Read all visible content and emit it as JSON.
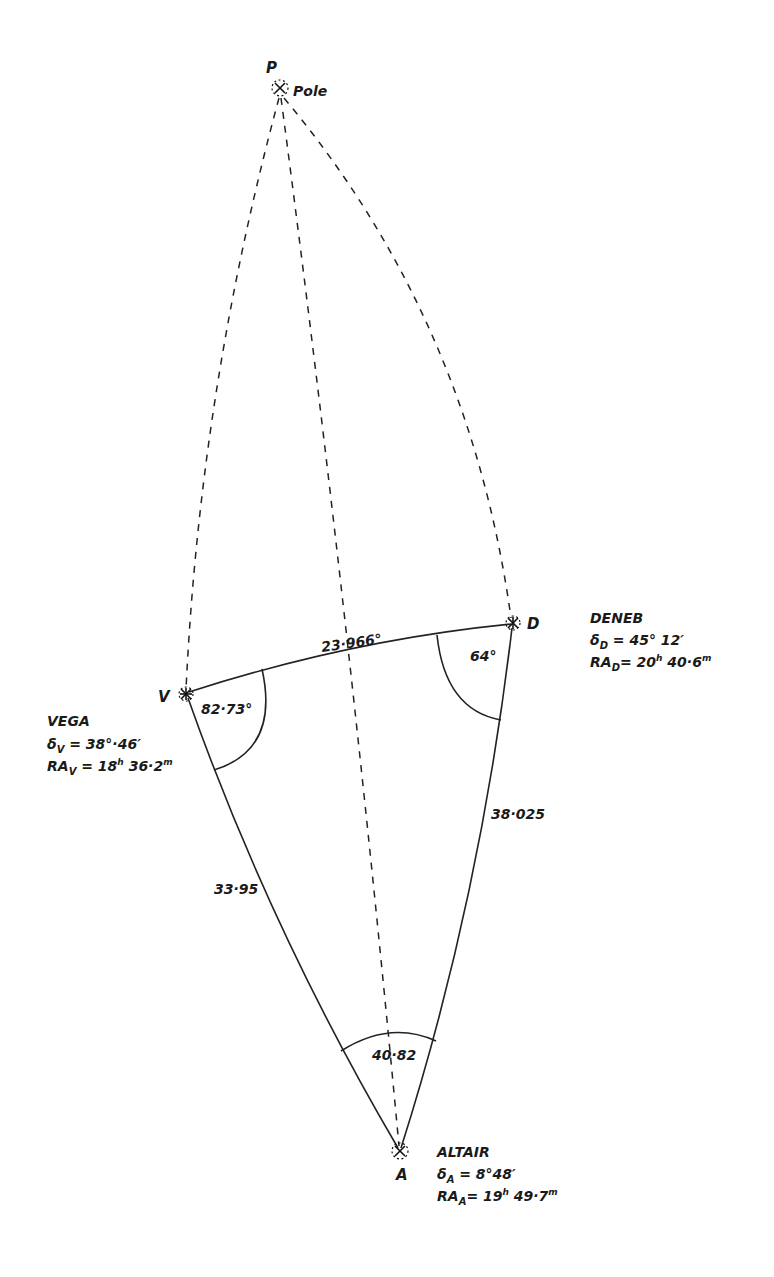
{
  "diagram": {
    "points": {
      "pole": {
        "letter": "P",
        "name": "Pole"
      },
      "vega": {
        "letter": "V",
        "name": "VEGA",
        "dec_symbol": "δ",
        "dec_sub": "V",
        "dec_value": "38°·46′",
        "ra_symbol": "RA",
        "ra_sub": "V",
        "ra_hours": "18",
        "ra_h_unit": "h",
        "ra_minutes": "36·2",
        "ra_m_unit": "m"
      },
      "deneb": {
        "letter": "D",
        "name": "DENEB",
        "dec_symbol": "δ",
        "dec_sub": "D",
        "dec_value": "45° 12′",
        "ra_symbol": "RA",
        "ra_sub": "D",
        "ra_hours": "20",
        "ra_h_unit": "h",
        "ra_minutes": "40·6",
        "ra_m_unit": "m"
      },
      "altair": {
        "letter": "A",
        "name": "ALTAIR",
        "dec_symbol": "δ",
        "dec_sub": "A",
        "dec_value": "8°48′",
        "ra_symbol": "RA",
        "ra_sub": "A",
        "ra_hours": "19",
        "ra_h_unit": "h",
        "ra_minutes": "49·7",
        "ra_m_unit": "m"
      }
    },
    "sides": {
      "VD": "23·966°",
      "VA": "33·95",
      "DA": "38·025"
    },
    "angles": {
      "V": "82·73°",
      "D": "64°",
      "A": "40·82"
    },
    "equals": "="
  }
}
